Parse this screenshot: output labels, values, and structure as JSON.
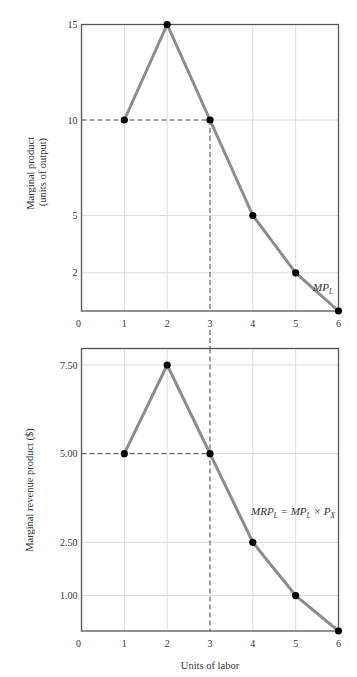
{
  "chart_data": [
    {
      "type": "line",
      "title": "",
      "xlabel": "",
      "ylabel": "Marginal product (units of output)",
      "ylabel_lines": [
        "Marginal product",
        "(units of output)"
      ],
      "x": [
        1,
        2,
        3,
        4,
        5,
        6
      ],
      "series": [
        {
          "name": "MP_L",
          "label": "MP",
          "label_sub": "L",
          "values": [
            10,
            15,
            10,
            5,
            2,
            0
          ]
        }
      ],
      "xticks": [
        "0",
        "1",
        "2",
        "3",
        "4",
        "5",
        "6"
      ],
      "yticks": [
        {
          "value": 2,
          "label": "2"
        },
        {
          "value": 5,
          "label": "5"
        },
        {
          "value": 10,
          "label": "10"
        },
        {
          "value": 15,
          "label": "15"
        }
      ],
      "xlim": [
        0,
        6
      ],
      "ylim": [
        0,
        15
      ],
      "grid": true,
      "annotations": [
        {
          "type": "dashed-guide",
          "x": 3,
          "y": 10,
          "note": "dashed lines from y-axis at 10 to point (3,10), then down from point"
        }
      ]
    },
    {
      "type": "line",
      "title": "",
      "xlabel": "Units of labor",
      "ylabel": "Marginal revenue product ($)",
      "x": [
        1,
        2,
        3,
        4,
        5,
        6
      ],
      "series": [
        {
          "name": "MRP_L = MP_L × P_X",
          "values": [
            5.0,
            7.5,
            5.0,
            2.5,
            1.0,
            0
          ]
        }
      ],
      "series_label": {
        "parts": [
          {
            "text": "MRP",
            "sub": "L"
          },
          {
            "text": " = MP",
            "sub": "L"
          },
          {
            "text": " × P",
            "sub": "X"
          }
        ]
      },
      "xticks": [
        "0",
        "1",
        "2",
        "3",
        "4",
        "5",
        "6"
      ],
      "yticks": [
        {
          "value": 1.0,
          "label": "1.00"
        },
        {
          "value": 2.5,
          "label": "2.50"
        },
        {
          "value": 5.0,
          "label": "5.00"
        },
        {
          "value": 7.5,
          "label": "7.50"
        }
      ],
      "xlim": [
        0,
        6
      ],
      "ylim": [
        0,
        7.9
      ],
      "grid": true,
      "annotations": [
        {
          "type": "dashed-guide",
          "x": 3,
          "y": 5.0,
          "note": "dashed horizontal from y-axis at 5.00; dashed vertical at x=3 continuing from upper chart"
        }
      ]
    }
  ],
  "colors": {
    "curve": "#8c8c8c",
    "point": "#000000",
    "axis": "#555555",
    "grid": "#dcdcdc",
    "dash": "#444444"
  }
}
